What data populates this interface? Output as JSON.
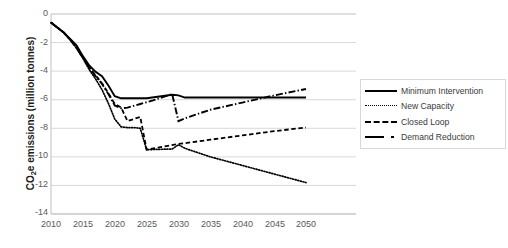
{
  "chart_data": {
    "type": "line",
    "title": "",
    "xlabel": "",
    "ylabel": "CO2e emissions (million tonnes)",
    "ylabel_parts": {
      "pre": "CO",
      "sub": "2",
      "post": "e emissions (million tonnes)"
    },
    "xlim": [
      2010,
      2050
    ],
    "ylim": [
      -14,
      0
    ],
    "xticks": [
      2010,
      2015,
      2020,
      2025,
      2030,
      2035,
      2040,
      2045,
      2050
    ],
    "yticks": [
      0,
      -2,
      -4,
      -6,
      -8,
      -10,
      -12,
      -14
    ],
    "xtick_labels": [
      "2010",
      "2015",
      "2020",
      "2025",
      "2030",
      "2035",
      "2040",
      "2045",
      "2050"
    ],
    "ytick_labels": [
      "0",
      "-2",
      "-4",
      "-6",
      "-8",
      "-10",
      "-12",
      "-14"
    ],
    "grid": "horizontal",
    "legend_position": "right",
    "series": [
      {
        "name": "Minimum Intervention",
        "style": "solid",
        "color": "#000000",
        "x": [
          2010,
          2011,
          2012,
          2013,
          2014,
          2015,
          2016,
          2017,
          2018,
          2019,
          2020,
          2021,
          2025,
          2029,
          2030,
          2031,
          2035,
          2040,
          2045,
          2050
        ],
        "y": [
          -0.6,
          -0.95,
          -1.3,
          -1.75,
          -2.2,
          -2.95,
          -3.6,
          -4.05,
          -4.35,
          -5.0,
          -5.75,
          -5.9,
          -5.9,
          -5.65,
          -5.7,
          -5.85,
          -5.85,
          -5.85,
          -5.85,
          -5.85
        ]
      },
      {
        "name": "New Capacity",
        "style": "dotted",
        "color": "#000000",
        "x": [
          2010,
          2011,
          2012,
          2013,
          2014,
          2015,
          2016,
          2017,
          2018,
          2019,
          2020,
          2021,
          2022,
          2023,
          2024,
          2025,
          2029,
          2030,
          2031,
          2035,
          2040,
          2045,
          2050
        ],
        "y": [
          -0.6,
          -0.95,
          -1.3,
          -1.8,
          -2.4,
          -3.1,
          -3.9,
          -4.55,
          -5.3,
          -6.25,
          -7.35,
          -7.9,
          -7.95,
          -7.95,
          -8.0,
          -9.5,
          -9.45,
          -9.15,
          -9.4,
          -10.0,
          -10.6,
          -11.2,
          -11.8
        ]
      },
      {
        "name": "Closed Loop",
        "style": "dashed",
        "color": "#000000",
        "x": [
          2010,
          2011,
          2012,
          2013,
          2014,
          2015,
          2016,
          2017,
          2018,
          2019,
          2020,
          2021,
          2022,
          2023,
          2024,
          2025,
          2030,
          2035,
          2040,
          2045,
          2050
        ],
        "y": [
          -0.6,
          -0.95,
          -1.3,
          -1.8,
          -2.35,
          -3.05,
          -3.75,
          -4.3,
          -4.85,
          -5.55,
          -6.3,
          -6.55,
          -7.5,
          -7.35,
          -7.2,
          -9.5,
          -9.1,
          -8.8,
          -8.5,
          -8.2,
          -7.95
        ]
      },
      {
        "name": "Demand Reduction",
        "style": "dashdot",
        "color": "#000000",
        "x": [
          2010,
          2011,
          2012,
          2013,
          2014,
          2015,
          2016,
          2017,
          2018,
          2019,
          2020,
          2021,
          2022,
          2024,
          2026,
          2028,
          2029,
          2030,
          2031,
          2035,
          2040,
          2045,
          2050
        ],
        "y": [
          -0.6,
          -0.95,
          -1.3,
          -1.8,
          -2.35,
          -3.05,
          -3.75,
          -4.35,
          -4.9,
          -5.6,
          -6.4,
          -6.6,
          -6.55,
          -6.3,
          -6.05,
          -5.75,
          -5.6,
          -7.5,
          -7.3,
          -6.7,
          -6.2,
          -5.7,
          -5.25
        ]
      }
    ]
  },
  "legend": {
    "items": [
      {
        "label": "Minimum Intervention",
        "style": "solid"
      },
      {
        "label": "New Capacity",
        "style": "dotted"
      },
      {
        "label": "Closed Loop",
        "style": "dashed"
      },
      {
        "label": "Demand Reduction",
        "style": "dashdot"
      }
    ]
  }
}
